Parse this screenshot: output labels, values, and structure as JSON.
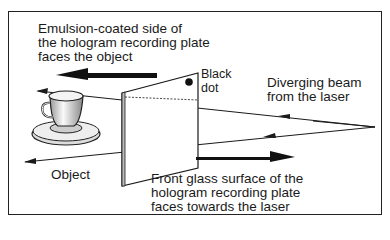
{
  "diagram": {
    "type": "hologram-recording-setup",
    "labels": {
      "emulsion": [
        "Emulsion-coated side of",
        "the hologram recording plate",
        "faces the object"
      ],
      "black_dot": [
        "Black",
        "dot"
      ],
      "beam": [
        "Diverging beam",
        "from the laser"
      ],
      "object": "Object",
      "front_glass": [
        "Front glass surface of the",
        "hologram recording plate",
        "faces towards the laser"
      ]
    },
    "elements": [
      "teacup-object",
      "hologram-plate",
      "black-dot",
      "laser-beam-rays",
      "direction-arrows"
    ],
    "colors": {
      "line": "#1a1a1a",
      "background": "#ffffff"
    }
  }
}
